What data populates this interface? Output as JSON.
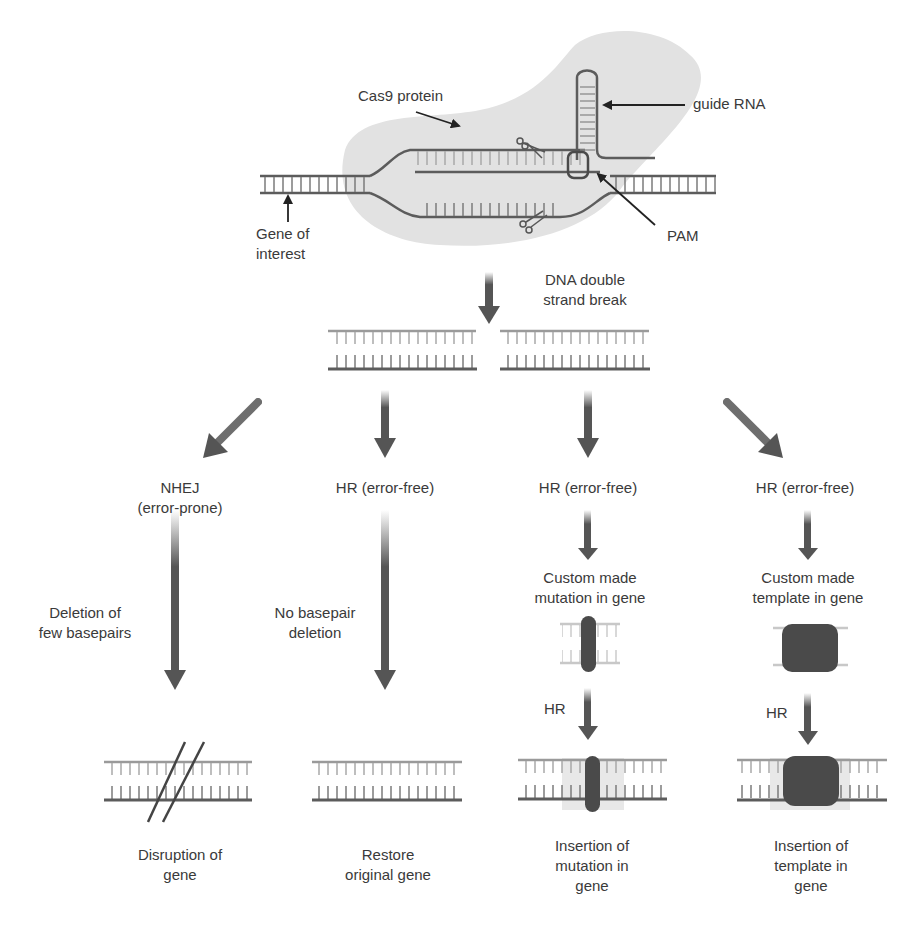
{
  "colors": {
    "strand_dark": "#5c5c5c",
    "strand_light": "#9a9a9a",
    "cas9_fill": "#e3e3e3",
    "arrow": "#555555",
    "insert_block": "#4a4a4a",
    "text": "#3a3a3a"
  },
  "top": {
    "cas9_label": "Cas9 protein",
    "guide_rna_label": "guide RNA",
    "pam_label": "PAM",
    "gene_label": "Gene of\ninterest",
    "icons": [
      "scissors-icon-top",
      "scissors-icon-bottom"
    ]
  },
  "break": {
    "label": "DNA double\nstrand break"
  },
  "pathways": [
    {
      "id": "nhej",
      "title": "NHEJ\n(error-prone)",
      "step_label": "Deletion of\nfew basepairs",
      "result": "Disruption of\ngene"
    },
    {
      "id": "hr-restore",
      "title": "HR (error-free)",
      "step_label": "No basepair\ndeletion",
      "result": "Restore\noriginal gene"
    },
    {
      "id": "hr-mutation",
      "title": "HR (error-free)",
      "intermediate": "Custom made\nmutation in gene",
      "step_label": "HR",
      "result": "Insertion of\nmutation in\ngene"
    },
    {
      "id": "hr-template",
      "title": "HR (error-free)",
      "intermediate": "Custom made\ntemplate in gene",
      "step_label": "HR",
      "result": "Insertion of\ntemplate in\ngene"
    }
  ]
}
